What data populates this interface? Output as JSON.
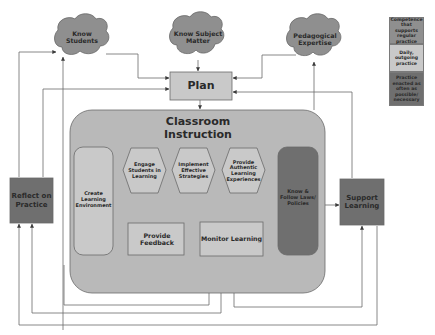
{
  "colors": {
    "competence": "#8f8f8f",
    "daily": "#c9c9c9",
    "as_needed": "#6f6f6f",
    "container": "#b9b9b9",
    "line": "#6a6a6a",
    "text": "#2a2a2a"
  },
  "legend": {
    "items": [
      {
        "label": "Competence that supports regular practice",
        "category": "competence"
      },
      {
        "label": "Daily, outgoing practice",
        "category": "daily"
      },
      {
        "label": "Practice enacted as often as possible/ necessary",
        "category": "as_needed"
      }
    ]
  },
  "clouds": {
    "know_students": "Know Students",
    "know_subject_matter": "Know Subject Matter",
    "pedagogical_expertise": "Pedagogical Expertise"
  },
  "nodes": {
    "plan": "Plan",
    "classroom_instruction": "Classroom Instruction",
    "create_learning_environment": "Create Learning Environment",
    "engage_students": "Engage Students in Learning",
    "implement_strategies": "Implement Effective Strategies",
    "provide_authentic": "Provide Authentic Learning Experiences",
    "know_follow_laws": "Know & Follow Laws/ Policies",
    "provide_feedback": "Provide Feedback",
    "monitor_learning": "Monitor Learning",
    "reflect_on_practice": "Reflect on Practice",
    "support_learning": "Support Learning"
  }
}
